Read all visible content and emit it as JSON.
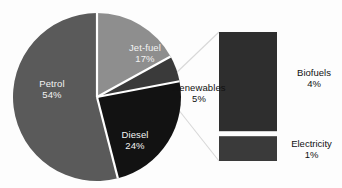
{
  "chart_data": {
    "type": "pie",
    "title": "",
    "subtitle": "",
    "xlabel": "",
    "ylabel": "",
    "grid": false,
    "legend_position": "none",
    "units": "percent",
    "categories": [
      "Petrol",
      "Jet-fuel",
      "Renewables",
      "Diesel"
    ],
    "values": [
      54,
      17,
      5,
      24
    ],
    "value_suffix": "%",
    "slices": [
      {
        "label": "Petrol",
        "value": 54,
        "value_text": "54%",
        "color": "#5a5a5a",
        "label_color": "#f2f2f2",
        "label_placement": "inside"
      },
      {
        "label": "Jet-fuel",
        "value": 17,
        "value_text": "17%",
        "color": "#8e8e8e",
        "label_color": "#f2f2f2",
        "label_placement": "inside"
      },
      {
        "label": "Renewables",
        "value": 5,
        "value_text": "5%",
        "color": "#3a3a3a",
        "label_color": "#111111",
        "label_placement": "outside"
      },
      {
        "label": "Diesel",
        "value": 24,
        "value_text": "24%",
        "color": "#121212",
        "label_color": "#f2f2f2",
        "label_placement": "inside"
      }
    ],
    "separator_color": "#ffffff",
    "exploded_segment": {
      "source_category": "Renewables",
      "source_value": 5,
      "type": "stacked_bar",
      "segments": [
        {
          "label": "Biofuels",
          "value": 4,
          "value_text": "4%",
          "color": "#2e2e2e",
          "label_color": "#111111"
        },
        {
          "label": "Electricity",
          "value": 1,
          "value_text": "1%",
          "color": "#3a3a3a",
          "label_color": "#111111"
        }
      ],
      "connector_color": "#d0d0d0"
    }
  },
  "pie": {
    "petrol": {
      "name": "Petrol",
      "value": "54%"
    },
    "jetfuel": {
      "name": "Jet-fuel",
      "value": "17%"
    },
    "renewables": {
      "name": "Renewables",
      "value": "5%"
    },
    "diesel": {
      "name": "Diesel",
      "value": "24%"
    }
  },
  "bar": {
    "biofuels": {
      "name": "Biofuels",
      "value": "4%"
    },
    "electricity": {
      "name": "Electricity",
      "value": "1%"
    }
  }
}
